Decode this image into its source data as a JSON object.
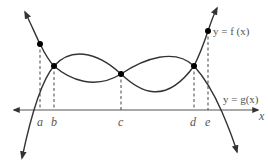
{
  "figure": {
    "type": "function-graph",
    "curves": [
      {
        "name": "f",
        "label": "y = f (x)",
        "label_position": "upper-right"
      },
      {
        "name": "g",
        "label": "y = g(x)",
        "label_position": "right, above x-axis"
      }
    ],
    "x_axis_label": "x",
    "x_ticks": [
      "a",
      "b",
      "c",
      "d",
      "e"
    ],
    "intersections": [
      "b",
      "c",
      "d"
    ],
    "marked_points_on_f": [
      "a",
      "e"
    ],
    "colors": {
      "curve": "#333333",
      "axis": "#555555",
      "text": "#555555"
    }
  }
}
